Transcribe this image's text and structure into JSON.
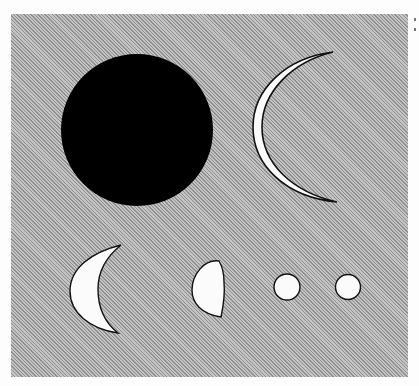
{
  "figure": {
    "colors": {
      "background": "#fdfdfd",
      "panel": "#a9a9a9",
      "dark_disk": "#000000",
      "lit_fill": "#fbfbfb",
      "outline": "#111111"
    },
    "shapes": [
      {
        "name": "dark-disk",
        "cx": 137,
        "cy": 130,
        "r": 76
      },
      {
        "name": "thin-crescent"
      },
      {
        "name": "crescent"
      },
      {
        "name": "half-phase"
      },
      {
        "name": "small-disk-1",
        "cx": 287,
        "cy": 287,
        "r": 13
      },
      {
        "name": "small-disk-2",
        "cx": 348,
        "cy": 287,
        "r": 12
      }
    ]
  }
}
